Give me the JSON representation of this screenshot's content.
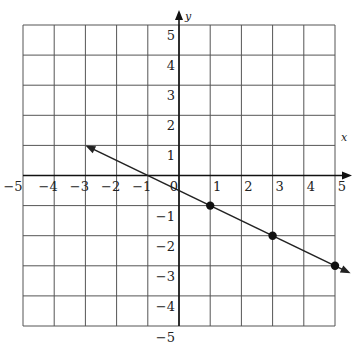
{
  "chart_data": {
    "type": "line",
    "title": "",
    "xlabel": "x",
    "ylabel": "y",
    "xlim": [
      -5,
      5
    ],
    "ylim": [
      -5,
      5
    ],
    "grid": true,
    "x_ticks": [
      "-5",
      "-4",
      "-3",
      "-2",
      "-1",
      "0",
      "1",
      "2",
      "3",
      "4",
      "5"
    ],
    "y_ticks": [
      "5",
      "4",
      "3",
      "2",
      "1",
      "-1",
      "-2",
      "-3",
      "-4",
      "-5"
    ],
    "series": [
      {
        "name": "line",
        "equation": "y = -x/2 - 1/2",
        "arrow_start": {
          "x": -3,
          "y": 1
        },
        "arrow_end": {
          "x": 5.5,
          "y": -3.25
        },
        "points": [
          {
            "x": 1,
            "y": -1
          },
          {
            "x": 3,
            "y": -2
          },
          {
            "x": 5,
            "y": -3
          }
        ]
      }
    ],
    "colors": {
      "grid": "#555555",
      "axis": "#111111",
      "line": "#222222",
      "point": "#111111"
    }
  }
}
